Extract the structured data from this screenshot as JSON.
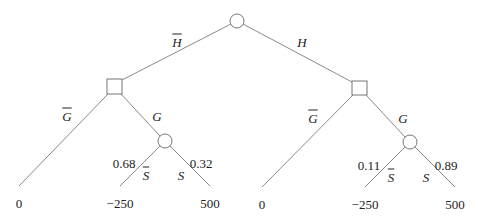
{
  "diagram": {
    "type": "decision-tree",
    "colors": {
      "line": "#8a8a8a",
      "node_stroke": "#777777",
      "text": "#222222"
    },
    "nodes": {
      "root": {
        "kind": "chance",
        "x": 237,
        "y": 21
      },
      "left_decision": {
        "kind": "decision",
        "x": 114.5,
        "y": 86.5
      },
      "right_decision": {
        "kind": "decision",
        "x": 359.5,
        "y": 88
      },
      "left_chance": {
        "kind": "chance",
        "x": 165,
        "y": 141
      },
      "right_chance": {
        "kind": "chance",
        "x": 410,
        "y": 142
      }
    },
    "branches": {
      "h_bar": {
        "label": "H",
        "overline": true
      },
      "h": {
        "label": "H",
        "overline": false
      },
      "left_g_bar": {
        "label": "G",
        "overline": true
      },
      "left_g": {
        "label": "G",
        "overline": false
      },
      "right_g_bar": {
        "label": "G",
        "overline": true
      },
      "right_g": {
        "label": "G",
        "overline": false
      },
      "left_s_bar": {
        "label": "S",
        "overline": true,
        "probability": "0.68"
      },
      "left_s": {
        "label": "S",
        "overline": false,
        "probability": "0.32"
      },
      "right_s_bar": {
        "label": "S",
        "overline": true,
        "probability": "0.11"
      },
      "right_s": {
        "label": "S",
        "overline": false,
        "probability": "0.89"
      }
    },
    "payoffs": {
      "left_no_g": "0",
      "left_s_bar": "−250",
      "left_s": "500",
      "right_no_g": "0",
      "right_s_bar": "−250",
      "right_s": "500"
    }
  }
}
